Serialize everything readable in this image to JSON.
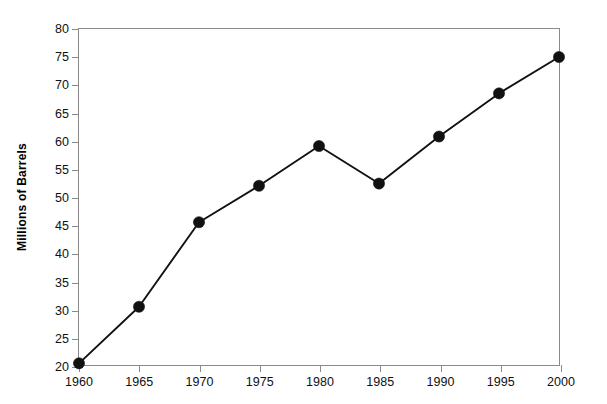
{
  "chart_data": {
    "type": "line",
    "title": "WORLD PRODUCTION OF CRUDE OIL",
    "subtitle": "(in millions of barrels per day)",
    "xlabel": "",
    "ylabel": "Millions of Barrels",
    "x": [
      1960,
      1965,
      1970,
      1975,
      1980,
      1985,
      1990,
      1995,
      2000
    ],
    "categories": [
      "1960",
      "1965",
      "1970",
      "1975",
      "1980",
      "1985",
      "1990",
      "1995",
      "2000"
    ],
    "values": [
      20.3,
      30.4,
      45.5,
      52.0,
      59.1,
      52.4,
      60.8,
      68.5,
      75.0
    ],
    "series": [
      {
        "name": "World crude oil production",
        "values": [
          20.3,
          30.4,
          45.5,
          52.0,
          59.1,
          52.4,
          60.8,
          68.5,
          75.0
        ]
      }
    ],
    "xlim": [
      1960,
      2000
    ],
    "ylim": [
      20,
      80
    ],
    "ytick_step": 5,
    "xtick_step": 5,
    "yticks": [
      20,
      25,
      30,
      35,
      40,
      45,
      50,
      55,
      60,
      65,
      70,
      75,
      80
    ],
    "ytick_labels": [
      "20",
      "25",
      "30",
      "35",
      "40",
      "45",
      "50",
      "55",
      "60",
      "65",
      "70",
      "75",
      "80"
    ],
    "xticks": [
      1960,
      1965,
      1970,
      1975,
      1980,
      1985,
      1990,
      1995,
      2000
    ],
    "xtick_labels": [
      "1960",
      "1965",
      "1970",
      "1975",
      "1980",
      "1985",
      "1990",
      "1995",
      "2000"
    ],
    "grid": false,
    "legend": false,
    "legend_position": "none",
    "marker": "filled-circle",
    "colors": {
      "line": "#111111",
      "marker": "#111111",
      "axis": "#8a8a8a",
      "text": "#111111",
      "background": "#ffffff"
    }
  }
}
